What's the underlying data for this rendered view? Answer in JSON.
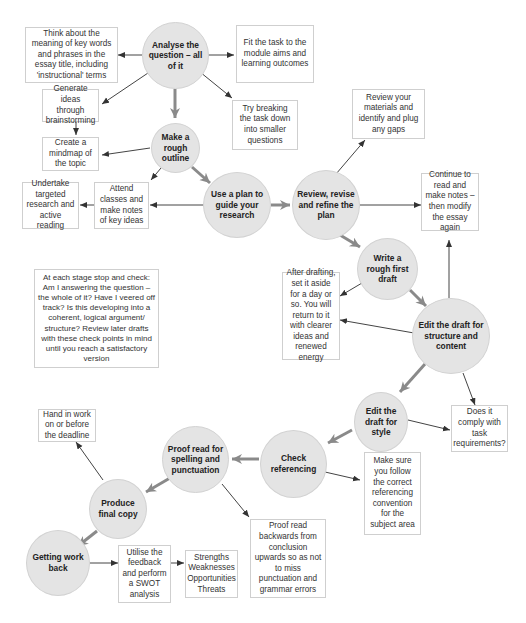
{
  "diagram": {
    "steps": [
      {
        "id": "analyse",
        "label": "Analyse the question – all of it"
      },
      {
        "id": "outline",
        "label": "Make a rough outline"
      },
      {
        "id": "plan",
        "label": "Use a plan to guide your research"
      },
      {
        "id": "review",
        "label": "Review, revise and refine the plan"
      },
      {
        "id": "draft",
        "label": "Write a rough first draft"
      },
      {
        "id": "edit_structure",
        "label": "Edit the draft for structure and content"
      },
      {
        "id": "edit_style",
        "label": "Edit the draft for style"
      },
      {
        "id": "referencing",
        "label": "Check referencing"
      },
      {
        "id": "proofread",
        "label": "Proof read for spelling and punctuation"
      },
      {
        "id": "final",
        "label": "Produce final copy"
      },
      {
        "id": "work_back",
        "label": "Getting work back"
      }
    ],
    "notes": [
      {
        "id": "key_words",
        "label": "Think about the meaning of key words and phrases in the essay title, including 'instructional' terms"
      },
      {
        "id": "fit_module",
        "label": "Fit the task to the module aims and learning outcomes"
      },
      {
        "id": "brainstorm",
        "label": "Generate ideas through brainstorming"
      },
      {
        "id": "break_down",
        "label": "Try breaking the task down into smaller questions"
      },
      {
        "id": "mindmap",
        "label": "Create a mindmap of the topic"
      },
      {
        "id": "review_materials",
        "label": "Review your materials and identify and plug any gaps"
      },
      {
        "id": "research",
        "label": "Undertake targeted research and active reading"
      },
      {
        "id": "classes",
        "label": "Attend classes and make notes of key ideas"
      },
      {
        "id": "continue_read",
        "label": "Continue to read and make notes – then modify the essay again"
      },
      {
        "id": "check",
        "label": "At each stage stop and check: Am I answering the question – the whole of it? Have I veered off track? Is this developing into a coherent, logical argument/ structure? Review later drafts with these check points in mind until you reach a satisfactory version"
      },
      {
        "id": "set_aside",
        "label": "After drafting, set it aside for a day or so. You will return to it with clearer ideas and renewed energy"
      },
      {
        "id": "comply",
        "label": "Does it comply with task requirements?"
      },
      {
        "id": "hand_in",
        "label": "Hand in work on or before the deadline"
      },
      {
        "id": "convention",
        "label": "Make sure you follow the correct referencing convention for the subject area"
      },
      {
        "id": "backwards",
        "label": "Proof read backwards from conclusion upwards so as not to miss punctuation and grammar errors"
      },
      {
        "id": "swot",
        "label": "Utilise the feedback and perform a SWOT analysis"
      },
      {
        "id": "swot_terms",
        "label": "Strengths Weaknesses Opportunities Threats"
      }
    ],
    "colors": {
      "node_fill": "#e4e4e4",
      "main_arrow": "#8a8a8a",
      "thin_arrow": "#444444",
      "box_border": "#cfcfcf"
    }
  }
}
